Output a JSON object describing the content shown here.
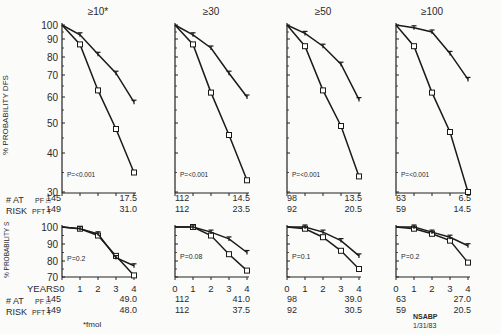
{
  "figure": {
    "top_ylabel": "% PROBABILITY DFS",
    "bottom_ylabel": "% PROBABILITY S",
    "xlabel": "YEARS",
    "footnote": "*fmol",
    "source": "NSABP",
    "date": "1/31/83",
    "at_risk_label_1": "# AT",
    "at_risk_label_2": "RISK",
    "pf_label": "PF □",
    "pft_label": "PFT T"
  },
  "chart_data": [
    {
      "type": "line",
      "title": "≥10*",
      "panel": "DFS",
      "x": [
        0,
        1,
        2,
        3,
        4
      ],
      "xlabel": "Years",
      "ylabel": "% Probability DFS",
      "ylim": [
        30,
        100
      ],
      "yticks": [
        100,
        90,
        80,
        70,
        60,
        50,
        40,
        30
      ],
      "series": [
        {
          "name": "PF",
          "marker": "square",
          "values": [
            100,
            87,
            63,
            48,
            35
          ]
        },
        {
          "name": "PFT",
          "marker": "T",
          "values": [
            100,
            93,
            81.5,
            71,
            58
          ]
        }
      ],
      "annotation": "P=<0.001",
      "at_risk": {
        "PF": [
          "145",
          "17.5"
        ],
        "PFT": [
          "149",
          "31.0"
        ]
      }
    },
    {
      "type": "line",
      "title": "≥30",
      "panel": "DFS",
      "x": [
        0,
        1,
        2,
        3,
        4
      ],
      "ylim": [
        30,
        100
      ],
      "series": [
        {
          "name": "PF",
          "marker": "square",
          "values": [
            100,
            87,
            62,
            46,
            33
          ]
        },
        {
          "name": "PFT",
          "marker": "T",
          "values": [
            100,
            93,
            85,
            71,
            60
          ]
        }
      ],
      "annotation": "P=<0.001",
      "at_risk": {
        "PF": [
          "112",
          "14.5"
        ],
        "PFT": [
          "112",
          "23.5"
        ]
      }
    },
    {
      "type": "line",
      "title": "≥50",
      "panel": "DFS",
      "x": [
        0,
        1,
        2,
        3,
        4
      ],
      "ylim": [
        30,
        100
      ],
      "series": [
        {
          "name": "PF",
          "marker": "square",
          "values": [
            100,
            86,
            63,
            49,
            34
          ]
        },
        {
          "name": "PFT",
          "marker": "T",
          "values": [
            100,
            94,
            86,
            76,
            59
          ]
        }
      ],
      "annotation": "P=<0.001",
      "at_risk": {
        "PF": [
          "98",
          "13.5"
        ],
        "PFT": [
          "92",
          "20.5"
        ]
      }
    },
    {
      "type": "line",
      "title": "≥100",
      "panel": "DFS",
      "x": [
        0,
        1,
        2,
        3,
        4
      ],
      "ylim": [
        30,
        100
      ],
      "series": [
        {
          "name": "PF",
          "marker": "square",
          "values": [
            100,
            86,
            62,
            47,
            30
          ]
        },
        {
          "name": "PFT",
          "marker": "T",
          "values": [
            100,
            98,
            95,
            82,
            68
          ]
        }
      ],
      "annotation": "P=<0.001",
      "at_risk": {
        "PF": [
          "63",
          "6.5"
        ],
        "PFT": [
          "59",
          "14.5"
        ]
      }
    },
    {
      "type": "line",
      "title": "≥10*",
      "panel": "S",
      "x": [
        0,
        1,
        2,
        3,
        4
      ],
      "xlabel": "Years",
      "ylabel": "% Probability S",
      "ylim": [
        70,
        100
      ],
      "yticks": [
        100,
        90,
        80,
        70
      ],
      "series": [
        {
          "name": "PF",
          "marker": "square",
          "values": [
            100,
            99,
            95,
            83,
            71
          ]
        },
        {
          "name": "PFT",
          "marker": "T",
          "values": [
            100,
            99,
            96,
            82,
            77
          ]
        }
      ],
      "annotation": "P=0.2",
      "at_risk": {
        "PF": [
          "145",
          "49.0"
        ],
        "PFT": [
          "149",
          "48.0"
        ]
      }
    },
    {
      "type": "line",
      "title": "≥30",
      "panel": "S",
      "x": [
        0,
        1,
        2,
        3,
        4
      ],
      "ylim": [
        70,
        100
      ],
      "series": [
        {
          "name": "PF",
          "marker": "square",
          "values": [
            100,
            100,
            95,
            84,
            74
          ]
        },
        {
          "name": "PFT",
          "marker": "T",
          "values": [
            100,
            100,
            97,
            93,
            85
          ]
        }
      ],
      "annotation": "P=0.08",
      "at_risk": {
        "PF": [
          "112",
          "41.0"
        ],
        "PFT": [
          "112",
          "37.5"
        ]
      }
    },
    {
      "type": "line",
      "title": "≥50",
      "panel": "S",
      "x": [
        0,
        1,
        2,
        3,
        4
      ],
      "ylim": [
        70,
        100
      ],
      "series": [
        {
          "name": "PF",
          "marker": "square",
          "values": [
            100,
            99,
            94,
            86,
            75
          ]
        },
        {
          "name": "PFT",
          "marker": "T",
          "values": [
            100,
            100,
            97,
            92,
            83
          ]
        }
      ],
      "annotation": "P=0.1",
      "at_risk": {
        "PF": [
          "98",
          "39.0"
        ],
        "PFT": [
          "92",
          "30.5"
        ]
      }
    },
    {
      "type": "line",
      "title": "≥100",
      "panel": "S",
      "x": [
        0,
        1,
        2,
        3,
        4
      ],
      "ylim": [
        70,
        100
      ],
      "series": [
        {
          "name": "PF",
          "marker": "square",
          "values": [
            100,
            99,
            96,
            92,
            79
          ]
        },
        {
          "name": "PFT",
          "marker": "T",
          "values": [
            100,
            100,
            97,
            94,
            89
          ]
        }
      ],
      "annotation": "P=0.2",
      "at_risk": {
        "PF": [
          "63",
          "27.0"
        ],
        "PFT": [
          "59",
          "20.5"
        ]
      }
    }
  ]
}
